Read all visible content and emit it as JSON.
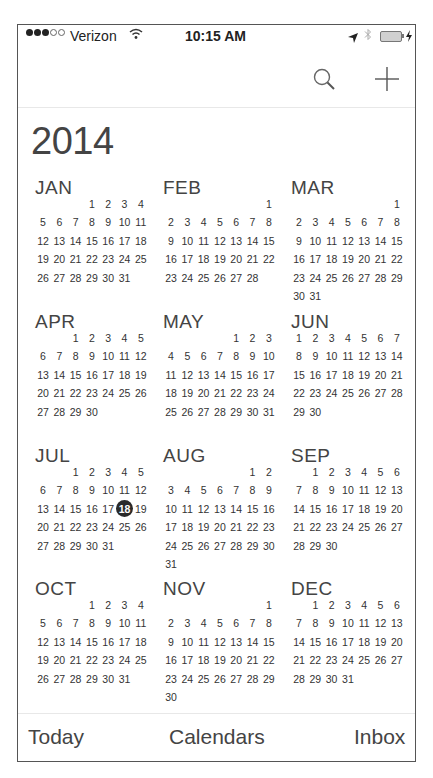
{
  "status_bar": {
    "signal_filled": 3,
    "signal_empty": 2,
    "carrier": "Verizon",
    "time": "10:15 AM",
    "icons": [
      "wifi-icon",
      "location-arrow-icon",
      "bluetooth-icon",
      "battery-icon",
      "charging-bolt-icon"
    ]
  },
  "nav": {
    "search_icon": "search-icon",
    "add_icon": "plus-icon"
  },
  "year": "2014",
  "today": {
    "month": "JUL",
    "day": 18,
    "highlight_color": "#2a2a2a"
  },
  "months": [
    {
      "name": "JAN",
      "start_weekday": 3,
      "days": 31
    },
    {
      "name": "FEB",
      "start_weekday": 6,
      "days": 28
    },
    {
      "name": "MAR",
      "start_weekday": 6,
      "days": 31
    },
    {
      "name": "APR",
      "start_weekday": 2,
      "days": 30
    },
    {
      "name": "MAY",
      "start_weekday": 4,
      "days": 31
    },
    {
      "name": "JUN",
      "start_weekday": 0,
      "days": 30
    },
    {
      "name": "JUL",
      "start_weekday": 2,
      "days": 31
    },
    {
      "name": "AUG",
      "start_weekday": 5,
      "days": 31
    },
    {
      "name": "SEP",
      "start_weekday": 1,
      "days": 30
    },
    {
      "name": "OCT",
      "start_weekday": 3,
      "days": 31
    },
    {
      "name": "NOV",
      "start_weekday": 6,
      "days": 30
    },
    {
      "name": "DEC",
      "start_weekday": 1,
      "days": 31
    }
  ],
  "tabbar": {
    "today": "Today",
    "calendars": "Calendars",
    "inbox": "Inbox"
  }
}
